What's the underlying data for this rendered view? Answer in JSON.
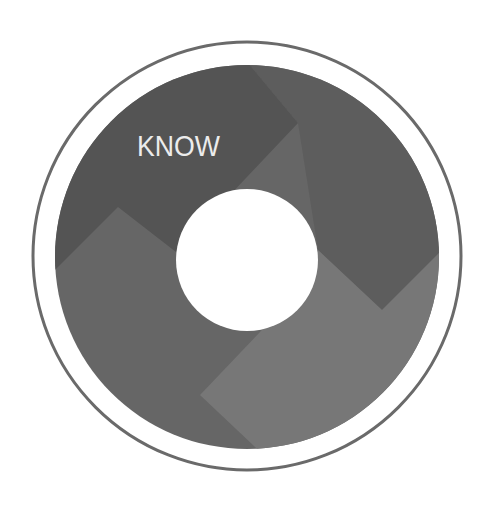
{
  "graphic": {
    "label": "KNOW",
    "colors": {
      "background": "#ffffff",
      "outer_ring": "#6a6a6a",
      "top_left_region": "#545454",
      "right_region": "#5d5d5d",
      "bottom_left_region": "#666666",
      "bottom_right_region": "#777777",
      "center_hole": "#ffffff",
      "label_text": "#ececec"
    }
  }
}
